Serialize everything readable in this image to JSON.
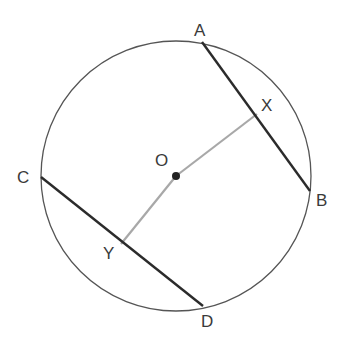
{
  "diagram": {
    "type": "circle-geometry",
    "circle": {
      "cx": 176,
      "cy": 176,
      "r": 135,
      "stroke": "#555555"
    },
    "center": {
      "label": "O",
      "x": 176,
      "y": 176
    },
    "points": {
      "A": {
        "label": "A",
        "x": 202,
        "y": 42
      },
      "B": {
        "label": "B",
        "x": 310,
        "y": 191
      },
      "C": {
        "label": "C",
        "x": 41,
        "y": 177
      },
      "D": {
        "label": "D",
        "x": 203,
        "y": 306
      },
      "X": {
        "label": "X",
        "x": 257,
        "y": 114
      },
      "Y": {
        "label": "Y",
        "x": 121,
        "y": 244
      }
    },
    "chords": [
      {
        "name": "AB",
        "from": "A",
        "to": "B",
        "color": "#2b2b2b"
      },
      {
        "name": "CD",
        "from": "C",
        "to": "D",
        "color": "#2b2b2b"
      }
    ],
    "perpendiculars": [
      {
        "name": "OX",
        "from": "O",
        "to": "X",
        "color": "#a8a8a8"
      },
      {
        "name": "OY",
        "from": "O",
        "to": "Y",
        "color": "#a8a8a8"
      }
    ]
  }
}
